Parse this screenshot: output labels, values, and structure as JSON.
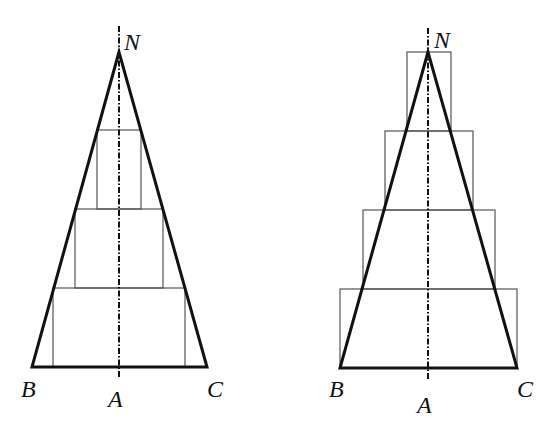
{
  "figures": [
    {
      "id": "inscribed",
      "description": "Triangle with inscribed step rectangles (lower sum)",
      "apex": {
        "label": "N",
        "x": 119,
        "y": 52
      },
      "base_left": {
        "label": "B",
        "x": 32,
        "y": 367
      },
      "base_right": {
        "label": "C",
        "x": 207,
        "y": 367
      },
      "axis_foot": {
        "label": "A",
        "x": 119,
        "y": 367
      },
      "rectangles": [
        {
          "x1": 97,
          "y1": 130,
          "x2": 141,
          "y2": 209
        },
        {
          "x1": 75,
          "y1": 209,
          "x2": 163,
          "y2": 288
        },
        {
          "x1": 53,
          "y1": 288,
          "x2": 185,
          "y2": 367
        }
      ]
    },
    {
      "id": "circumscribed",
      "description": "Triangle with circumscribed step rectangles (upper sum)",
      "apex": {
        "label": "N",
        "x": 428,
        "y": 52
      },
      "base_left": {
        "label": "B",
        "x": 340,
        "y": 368
      },
      "base_right": {
        "label": "C",
        "x": 517,
        "y": 368
      },
      "axis_foot": {
        "label": "A",
        "x": 428,
        "y": 368
      },
      "rectangles": [
        {
          "x1": 407,
          "y1": 52,
          "x2": 451,
          "y2": 131
        },
        {
          "x1": 385,
          "y1": 131,
          "x2": 473,
          "y2": 210
        },
        {
          "x1": 363,
          "y1": 210,
          "x2": 495,
          "y2": 289
        },
        {
          "x1": 340,
          "y1": 289,
          "x2": 517,
          "y2": 368
        }
      ]
    }
  ],
  "labels": {
    "left": {
      "N": "N",
      "B": "B",
      "A": "A",
      "C": "C"
    },
    "right": {
      "N": "N",
      "B": "B",
      "A": "A",
      "C": "C"
    }
  },
  "colors": {
    "stroke": "#111111",
    "thin_stroke": "#555555",
    "background": "#ffffff"
  }
}
